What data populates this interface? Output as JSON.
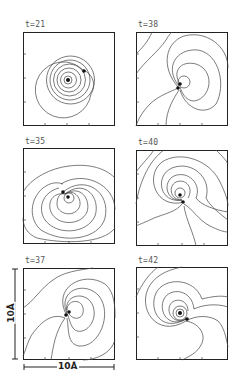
{
  "figure": {
    "panels": [
      {
        "id": "t21",
        "label": "t=21"
      },
      {
        "id": "t38",
        "label": "t=38"
      },
      {
        "id": "t35",
        "label": "t=35"
      },
      {
        "id": "t40",
        "label": "t=40"
      },
      {
        "id": "t37",
        "label": "t=37"
      },
      {
        "id": "t42",
        "label": "t=42"
      }
    ],
    "scale_bar": {
      "horizontal": "10Å",
      "vertical": "10Å"
    }
  },
  "colors": {
    "line": "#333333",
    "frame": "#222222",
    "background": "#ffffff"
  }
}
